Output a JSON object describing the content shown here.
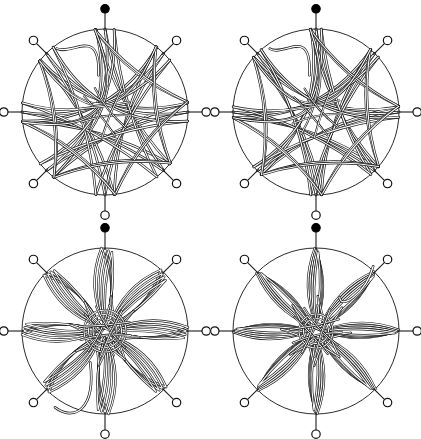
{
  "figure": {
    "width": 421,
    "height": 439,
    "background": "#ffffff",
    "stroke_color": "#1a1a1a",
    "highlight_color": "#ffffff",
    "rows": 2,
    "cols": 2
  },
  "geometry": {
    "panel_width": 211,
    "panel_height": 220,
    "center_x": 105,
    "center_y": 112,
    "circle_radius": 83,
    "node_radius": 4.2,
    "node_count": 8,
    "node_start_angle_deg": -90,
    "band_outer_width": 2.6,
    "band_inner_width": 1.2
  },
  "nodes": [
    {
      "index": 0,
      "name": "node-n",
      "angle_deg": -90,
      "type": "filled",
      "stem": 16
    },
    {
      "index": 1,
      "name": "node-ne",
      "angle_deg": -45,
      "type": "open",
      "stem": 14
    },
    {
      "index": 2,
      "name": "node-e",
      "angle_deg": 0,
      "type": "open",
      "stem": 14
    },
    {
      "index": 3,
      "name": "node-se",
      "angle_deg": 45,
      "type": "open",
      "stem": 14
    },
    {
      "index": 4,
      "name": "node-s",
      "angle_deg": 90,
      "type": "open",
      "stem": 16
    },
    {
      "index": 5,
      "name": "node-sw",
      "angle_deg": 135,
      "type": "open",
      "stem": 14
    },
    {
      "index": 6,
      "name": "node-w",
      "angle_deg": 180,
      "type": "open",
      "stem": 14
    },
    {
      "index": 7,
      "name": "node-nw",
      "angle_deg": -135,
      "type": "open",
      "stem": 14
    }
  ],
  "panels": [
    {
      "id": "panel-top-left",
      "name": "knot-diagram-top-left",
      "position": {
        "left": 0,
        "top": 0
      },
      "style": "star",
      "chord_step": 3,
      "strand_copies": 3,
      "copy_offset": 2.1,
      "bulge": 0.18,
      "twist_deg": 7,
      "petal_width": 0,
      "tail": {
        "present": true,
        "direction": "up-left",
        "length": 46,
        "curl": 0.55
      },
      "core_knot": "open-weave"
    },
    {
      "id": "panel-top-right",
      "name": "knot-diagram-top-right",
      "position": {
        "left": 211,
        "top": 0
      },
      "style": "star",
      "chord_step": 3,
      "strand_copies": 3,
      "copy_offset": 2.1,
      "bulge": 0.15,
      "twist_deg": 4,
      "petal_width": 0,
      "tail": {
        "present": true,
        "direction": "up-left",
        "length": 44,
        "curl": 0.5
      },
      "core_knot": "open-weave-with-spine"
    },
    {
      "id": "panel-bottom-left",
      "name": "knot-diagram-bottom-left",
      "position": {
        "left": 0,
        "top": 219
      },
      "style": "petal",
      "chord_step": 4,
      "strand_copies": 4,
      "copy_offset": 2.4,
      "bulge": 0.0,
      "twist_deg": 10,
      "petal_width": 17,
      "tail": {
        "present": true,
        "direction": "down-left",
        "length": 50,
        "curl": 0.6
      },
      "core_knot": "loose-bundle"
    },
    {
      "id": "panel-bottom-right",
      "name": "knot-diagram-bottom-right",
      "position": {
        "left": 211,
        "top": 219
      },
      "style": "petal",
      "chord_step": 4,
      "strand_copies": 4,
      "copy_offset": 2.4,
      "bulge": 0.0,
      "twist_deg": 3,
      "petal_width": 15,
      "tail": {
        "present": true,
        "direction": "up-right",
        "length": 52,
        "curl": 0.55
      },
      "core_knot": "tight-rosette"
    }
  ]
}
